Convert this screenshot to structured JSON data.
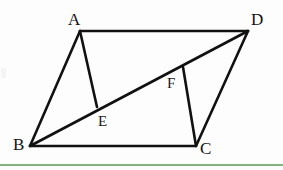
{
  "figure": {
    "canvas": {
      "width": 283,
      "height": 170
    },
    "background_color": "#fdfdfd",
    "stroke_color": "#111111",
    "accent_color": "#84b184",
    "labels": {
      "A": "A",
      "B": "B",
      "C": "C",
      "D": "D",
      "E": "E",
      "F": "F"
    }
  },
  "chart_data": {
    "type": "diagram",
    "title": "",
    "points": [
      {
        "name": "A",
        "x": 80,
        "y": 31,
        "label": "A",
        "label_x": 68,
        "label_y": 11
      },
      {
        "name": "D",
        "x": 248,
        "y": 31,
        "label": "D",
        "label_x": 251,
        "label_y": 11
      },
      {
        "name": "B",
        "x": 30,
        "y": 146,
        "label": "B",
        "label_x": 13,
        "label_y": 136
      },
      {
        "name": "C",
        "x": 196,
        "y": 146,
        "label": "C",
        "label_x": 200,
        "label_y": 140
      },
      {
        "name": "E",
        "x": 97,
        "y": 107,
        "label": "E",
        "label_x": 98,
        "label_y": 114
      },
      {
        "name": "F",
        "x": 183,
        "y": 67,
        "label": "F",
        "label_x": 167,
        "label_y": 76
      }
    ],
    "segments": [
      {
        "name": "AD",
        "from": "A",
        "to": "D"
      },
      {
        "name": "AB",
        "from": "A",
        "to": "B"
      },
      {
        "name": "BC",
        "from": "B",
        "to": "C"
      },
      {
        "name": "DC",
        "from": "D",
        "to": "C"
      },
      {
        "name": "BD",
        "from": "B",
        "to": "D"
      },
      {
        "name": "AE",
        "from": "A",
        "to": "E"
      },
      {
        "name": "FC",
        "from": "F",
        "to": "C"
      }
    ],
    "accent_rule": {
      "y": 165,
      "color": "#84b184"
    }
  }
}
